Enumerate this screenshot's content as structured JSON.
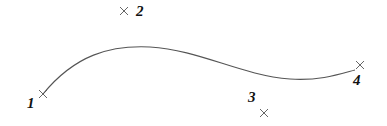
{
  "diagram": {
    "type": "bezier-curve",
    "colors": {
      "curve": "#555555",
      "marker": "#555555",
      "label": "#111111",
      "background": "#ffffff"
    },
    "curve": {
      "path": "M43,94 C75,55 110,45 150,47 C200,50 240,75 290,79 C320,81 340,74 355,70"
    },
    "points": [
      {
        "id": "1",
        "label": "1",
        "marker": {
          "x": 43,
          "y": 94
        },
        "label_pos": {
          "x": 27,
          "y": 108
        }
      },
      {
        "id": "2",
        "label": "2",
        "marker": {
          "x": 124,
          "y": 11
        },
        "label_pos": {
          "x": 136,
          "y": 16
        }
      },
      {
        "id": "3",
        "label": "3",
        "marker": {
          "x": 264,
          "y": 113
        },
        "label_pos": {
          "x": 248,
          "y": 102
        }
      },
      {
        "id": "4",
        "label": "4",
        "marker": {
          "x": 360,
          "y": 65
        },
        "label_pos": {
          "x": 353,
          "y": 85
        }
      }
    ]
  }
}
